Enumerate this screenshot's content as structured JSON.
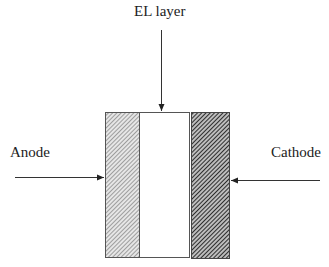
{
  "diagram": {
    "labels": {
      "el_layer": "EL layer",
      "anode": "Anode",
      "cathode": "Cathode"
    },
    "layers": [
      {
        "name": "anode-layer",
        "fill": "light-hatch"
      },
      {
        "name": "el-layer",
        "fill": "#ffffff"
      },
      {
        "name": "cathode-layer",
        "fill": "dark-hatch"
      }
    ],
    "colors": {
      "line": "#333333",
      "light_hatch": "#9a9a9a",
      "dark_hatch": "#3a3a3a"
    }
  }
}
